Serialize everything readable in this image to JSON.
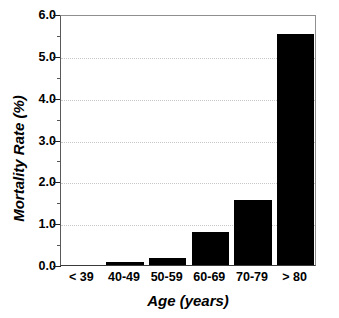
{
  "chart_data": {
    "type": "bar",
    "title": "",
    "subtitle": "",
    "categories": [
      "< 39",
      "40-49",
      "50-59",
      "60-69",
      "70-79",
      "> 80"
    ],
    "values": [
      0.0,
      0.07,
      0.17,
      0.79,
      1.56,
      5.52
    ],
    "xlabel": "Age  (years)",
    "ylabel": "Mortality Rate (%)",
    "ylim": [
      0.0,
      6.0
    ],
    "ytick_labels": [
      "0.0",
      "1.0",
      "2.0",
      "3.0",
      "4.0",
      "5.0",
      "6.0"
    ],
    "ytick_values": [
      0.0,
      1.0,
      2.0,
      3.0,
      4.0,
      5.0,
      6.0
    ],
    "yminor_tick_values": [
      0.5,
      1.5,
      2.5,
      3.5,
      4.5,
      5.5
    ],
    "grid": true,
    "grid_axis": "y",
    "grid_style": "dotted",
    "legend": false,
    "legend_position": "none",
    "bar_color": "#000000",
    "grid_color": "#c9c9c9",
    "axis_color": "#3a3a3a",
    "text_color": "#000000",
    "background_color": "#ffffff"
  }
}
